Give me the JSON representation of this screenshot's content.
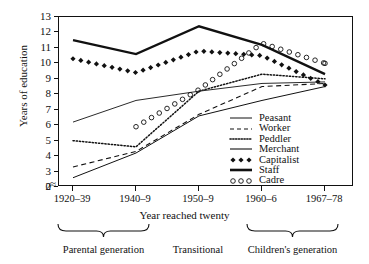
{
  "chart_data": {
    "type": "line",
    "title": "",
    "xlabel": "Year reached twenty",
    "ylabel": "Years of education",
    "categories": [
      "1920–39",
      "1940–9",
      "1950–9",
      "1960–6",
      "1967–78"
    ],
    "yticks": [
      0,
      2,
      3,
      4,
      5,
      6,
      7,
      8,
      9,
      10,
      11,
      12,
      13
    ],
    "ylim": [
      2,
      13
    ],
    "axis_break": true,
    "grid": false,
    "legend_position": "inside-bottom-right",
    "series": [
      {
        "name": "Peasant",
        "style": "thin-solid",
        "values": [
          2.6,
          4.2,
          6.6,
          7.6,
          8.5
        ]
      },
      {
        "name": "Worker",
        "style": "dashed",
        "values": [
          3.3,
          4.3,
          6.7,
          8.5,
          8.7
        ]
      },
      {
        "name": "Peddler",
        "style": "dotted",
        "values": [
          5.0,
          4.6,
          8.2,
          9.3,
          9.0
        ]
      },
      {
        "name": "Merchant",
        "style": "thin-solid-2",
        "values": [
          6.2,
          7.6,
          8.2,
          8.7,
          8.8
        ]
      },
      {
        "name": "Capitalist",
        "style": "diamonds",
        "values": [
          10.3,
          9.4,
          10.8,
          10.5,
          8.6
        ]
      },
      {
        "name": "Staff",
        "style": "thick-solid",
        "values": [
          11.5,
          10.6,
          12.4,
          11.2,
          9.3
        ]
      },
      {
        "name": "Cadre",
        "style": "open-circles",
        "values": [
          null,
          5.9,
          8.3,
          11.3,
          10.0
        ]
      }
    ],
    "annotations": {
      "brackets": [
        {
          "label": "Parental generation",
          "from": "1920–39",
          "to": "1940–9"
        },
        {
          "label": "Transitional",
          "from": "1950–9",
          "to": "1950–9"
        },
        {
          "label": "Children's generation",
          "from": "1960–6",
          "to": "1967–78"
        }
      ]
    }
  },
  "legend": {
    "items": [
      {
        "label": "Peasant"
      },
      {
        "label": "Worker"
      },
      {
        "label": "Peddler"
      },
      {
        "label": "Merchant"
      },
      {
        "label": "Capitalist"
      },
      {
        "label": "Staff"
      },
      {
        "label": "Cadre"
      }
    ]
  },
  "axis": {
    "break_symbol": "≈"
  }
}
